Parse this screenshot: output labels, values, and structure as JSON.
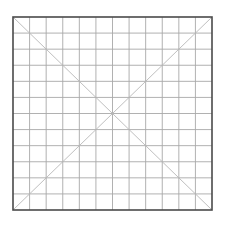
{
  "diagram": {
    "type": "grid-with-diagonals",
    "rows": 12,
    "cols": 12,
    "frame": {
      "x": 13,
      "y": 17,
      "width": 199,
      "height": 193
    },
    "colors": {
      "background": "#ffffff",
      "border": "#4a4a4a",
      "grid_line": "#a8a8a8",
      "diagonal": "#b8b8b8"
    },
    "stroke_widths": {
      "border": 1.6,
      "grid_line": 0.9,
      "diagonal": 0.9
    },
    "diagonals": [
      {
        "name": "top-left-to-bottom-right"
      },
      {
        "name": "top-right-to-bottom-left"
      }
    ]
  }
}
